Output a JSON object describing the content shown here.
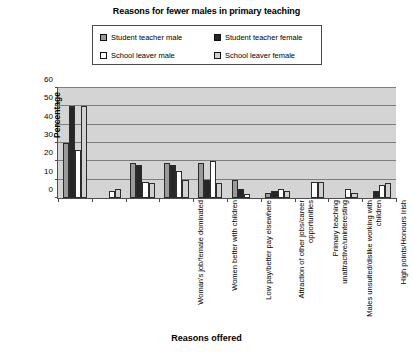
{
  "chart_data": {
    "type": "bar",
    "title": "Reasons for fewer males in primary teaching",
    "xlabel": "Reasons offered",
    "ylabel": "Percentage",
    "ylim": [
      0,
      60
    ],
    "yticks": [
      0,
      10,
      20,
      30,
      40,
      50,
      60
    ],
    "grid": true,
    "legend_position": "top-center",
    "categories": [
      "Woman's job/female dominated",
      "Women better with children",
      "Low pay/better pay elsewhere",
      "Attraction of other jobs/career opportunities",
      "Primary teaching unattractive/uninteresting",
      "Males unsuited/dislike working with children",
      "High points/Honours Irish",
      "Fear of abuse allegations",
      "Young children difficult",
      "Other"
    ],
    "series": [
      {
        "name": "Student teacher male",
        "color": "#9a9a9a",
        "values": [
          30,
          0,
          19,
          19,
          19,
          10,
          3,
          0,
          0,
          0
        ]
      },
      {
        "name": "Student teacher female",
        "color": "#262626",
        "values": [
          50,
          0,
          18,
          18,
          10,
          5,
          4,
          0,
          0,
          4
        ]
      },
      {
        "name": "School leaver male",
        "color": "#ffffff",
        "values": [
          26,
          4,
          9,
          15,
          20,
          2,
          5,
          9,
          5,
          7
        ]
      },
      {
        "name": "School leaver female",
        "color": "#d0d0d0",
        "values": [
          50,
          5,
          8,
          10,
          8,
          0,
          4,
          9,
          3,
          8
        ]
      }
    ]
  },
  "legend": {
    "items": [
      {
        "label": "Student teacher male",
        "color": "#9a9a9a"
      },
      {
        "label": "Student teacher female",
        "color": "#262626"
      },
      {
        "label": "School leaver male",
        "color": "#ffffff"
      },
      {
        "label": "School leaver female",
        "color": "#d0d0d0"
      }
    ]
  }
}
